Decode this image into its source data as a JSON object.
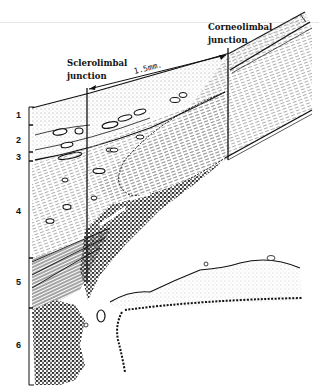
{
  "figure": {
    "type": "histological line drawing",
    "labels": {
      "sclerolimbal_line1": "Sclerolimbal",
      "sclerolimbal_line2": "junction",
      "corneolimbal_line1": "Corneolimbal",
      "corneolimbal_line2": "junction",
      "measurement": "1.5mm."
    },
    "layer_numbers": [
      "1",
      "2",
      "3",
      "4",
      "5",
      "6"
    ],
    "colors": {
      "ink": "#111111",
      "stipple": "#8a8a8a",
      "background": "#ffffff"
    }
  }
}
